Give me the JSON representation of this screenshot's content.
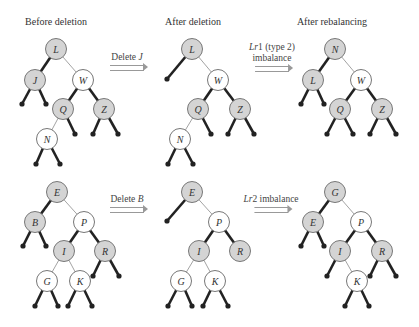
{
  "column_titles": [
    "Before deletion",
    "After deletion",
    "After rebalancing"
  ],
  "operations": [
    {
      "label_italic": "",
      "label_plain": "Delete ",
      "label_tail_italic": "J",
      "line2": ""
    },
    {
      "label_italic": "Lr",
      "label_plain": "1 (type 2)",
      "label_tail_italic": "",
      "line2": "imbalance"
    },
    {
      "label_italic": "",
      "label_plain": "Delete ",
      "label_tail_italic": "B",
      "line2": ""
    },
    {
      "label_italic": "Lr",
      "label_plain": "2 imbalance",
      "label_tail_italic": "",
      "line2": ""
    }
  ],
  "colors": {
    "shaded_node": "#d4d4d4",
    "white_node": "#ffffff",
    "node_stroke": "#777777",
    "heavy_edge": "#222222",
    "light_edge": "#999999"
  },
  "trees": [
    {
      "name": "top-before",
      "nodes": [
        {
          "id": "L",
          "x": 56,
          "y": 49,
          "shaded": true
        },
        {
          "id": "J",
          "x": 35,
          "y": 80,
          "shaded": true
        },
        {
          "id": "W",
          "x": 83,
          "y": 80,
          "shaded": false
        },
        {
          "id": "Q",
          "x": 63,
          "y": 109,
          "shaded": true
        },
        {
          "id": "Z",
          "x": 104,
          "y": 109,
          "shaded": true
        },
        {
          "id": "N",
          "x": 47,
          "y": 139,
          "shaded": false
        }
      ],
      "edges": [
        [
          "L",
          "J",
          1
        ],
        [
          "L",
          "W",
          0
        ],
        [
          "W",
          "Q",
          1
        ],
        [
          "W",
          "Z",
          1
        ],
        [
          "Q",
          "N",
          0
        ]
      ],
      "leaves": [
        [
          "J",
          22,
          104
        ],
        [
          "J",
          46,
          104
        ],
        [
          "Q",
          75,
          134
        ],
        [
          "Z",
          93,
          134
        ],
        [
          "Z",
          118,
          134
        ],
        [
          "N",
          36,
          164
        ],
        [
          "N",
          60,
          164
        ]
      ]
    },
    {
      "name": "top-after-deletion",
      "nodes": [
        {
          "id": "L",
          "x": 192,
          "y": 49,
          "shaded": true
        },
        {
          "id": "W",
          "x": 218,
          "y": 80,
          "shaded": false
        },
        {
          "id": "Q",
          "x": 198,
          "y": 109,
          "shaded": true
        },
        {
          "id": "Z",
          "x": 240,
          "y": 109,
          "shaded": true
        },
        {
          "id": "N",
          "x": 180,
          "y": 139,
          "shaded": false
        }
      ],
      "edges": [
        [
          "L",
          "W",
          0
        ],
        [
          "W",
          "Q",
          1
        ],
        [
          "W",
          "Z",
          1
        ],
        [
          "Q",
          "N",
          0
        ]
      ],
      "leaves": [
        [
          "L",
          167,
          79
        ],
        [
          "Q",
          211,
          134
        ],
        [
          "Z",
          228,
          134
        ],
        [
          "Z",
          254,
          134
        ],
        [
          "N",
          168,
          164
        ],
        [
          "N",
          193,
          164
        ]
      ]
    },
    {
      "name": "top-after-rebalancing",
      "nodes": [
        {
          "id": "N",
          "x": 335,
          "y": 49,
          "shaded": true
        },
        {
          "id": "L",
          "x": 313,
          "y": 80,
          "shaded": true
        },
        {
          "id": "W",
          "x": 361,
          "y": 80,
          "shaded": false
        },
        {
          "id": "Q",
          "x": 340,
          "y": 109,
          "shaded": true
        },
        {
          "id": "Z",
          "x": 382,
          "y": 109,
          "shaded": true
        }
      ],
      "edges": [
        [
          "N",
          "L",
          1
        ],
        [
          "N",
          "W",
          0
        ],
        [
          "W",
          "Q",
          1
        ],
        [
          "W",
          "Z",
          1
        ]
      ],
      "leaves": [
        [
          "L",
          301,
          104
        ],
        [
          "L",
          324,
          104
        ],
        [
          "Q",
          327,
          134
        ],
        [
          "Q",
          353,
          134
        ],
        [
          "Z",
          370,
          134
        ],
        [
          "Z",
          396,
          134
        ]
      ]
    },
    {
      "name": "bottom-before",
      "nodes": [
        {
          "id": "E",
          "x": 57,
          "y": 192,
          "shaded": true
        },
        {
          "id": "B",
          "x": 35,
          "y": 222,
          "shaded": true
        },
        {
          "id": "P",
          "x": 84,
          "y": 222,
          "shaded": false
        },
        {
          "id": "I",
          "x": 64,
          "y": 251,
          "shaded": true
        },
        {
          "id": "R",
          "x": 105,
          "y": 251,
          "shaded": true
        },
        {
          "id": "G",
          "x": 47,
          "y": 281,
          "shaded": false
        },
        {
          "id": "K",
          "x": 80,
          "y": 281,
          "shaded": false
        }
      ],
      "edges": [
        [
          "E",
          "B",
          1
        ],
        [
          "E",
          "P",
          0
        ],
        [
          "P",
          "I",
          1
        ],
        [
          "P",
          "R",
          1
        ],
        [
          "I",
          "G",
          0
        ],
        [
          "I",
          "K",
          0
        ]
      ],
      "leaves": [
        [
          "B",
          23,
          246
        ],
        [
          "B",
          46,
          246
        ],
        [
          "R",
          93,
          276
        ],
        [
          "R",
          119,
          276
        ],
        [
          "G",
          35,
          306
        ],
        [
          "G",
          58,
          306
        ],
        [
          "K",
          68,
          306
        ],
        [
          "K",
          92,
          306
        ]
      ]
    },
    {
      "name": "bottom-after-deletion",
      "nodes": [
        {
          "id": "E",
          "x": 192,
          "y": 192,
          "shaded": true
        },
        {
          "id": "P",
          "x": 219,
          "y": 222,
          "shaded": false
        },
        {
          "id": "I",
          "x": 199,
          "y": 251,
          "shaded": true
        },
        {
          "id": "R",
          "x": 240,
          "y": 251,
          "shaded": true
        },
        {
          "id": "G",
          "x": 181,
          "y": 281,
          "shaded": false
        },
        {
          "id": "K",
          "x": 215,
          "y": 281,
          "shaded": false
        }
      ],
      "edges": [
        [
          "E",
          "P",
          0
        ],
        [
          "P",
          "I",
          1
        ],
        [
          "P",
          "R",
          1
        ],
        [
          "I",
          "G",
          0
        ],
        [
          "I",
          "K",
          0
        ]
      ],
      "leaves": [
        [
          "E",
          167,
          221
        ],
        [
          "G",
          168,
          306
        ],
        [
          "G",
          192,
          306
        ],
        [
          "K",
          203,
          306
        ],
        [
          "K",
          228,
          306
        ]
      ]
    },
    {
      "name": "bottom-after-rebalancing",
      "nodes": [
        {
          "id": "G",
          "x": 335,
          "y": 192,
          "shaded": true
        },
        {
          "id": "E",
          "x": 313,
          "y": 222,
          "shaded": true
        },
        {
          "id": "P",
          "x": 361,
          "y": 222,
          "shaded": false
        },
        {
          "id": "I",
          "x": 340,
          "y": 251,
          "shaded": true
        },
        {
          "id": "R",
          "x": 382,
          "y": 251,
          "shaded": true
        },
        {
          "id": "K",
          "x": 357,
          "y": 281,
          "shaded": false
        }
      ],
      "edges": [
        [
          "G",
          "E",
          1
        ],
        [
          "G",
          "P",
          0
        ],
        [
          "P",
          "I",
          1
        ],
        [
          "P",
          "R",
          1
        ],
        [
          "I",
          "K",
          0
        ]
      ],
      "leaves": [
        [
          "E",
          301,
          246
        ],
        [
          "E",
          324,
          246
        ],
        [
          "I",
          327,
          276
        ],
        [
          "R",
          370,
          276
        ],
        [
          "R",
          396,
          276
        ],
        [
          "K",
          345,
          306
        ],
        [
          "K",
          369,
          306
        ]
      ]
    }
  ]
}
